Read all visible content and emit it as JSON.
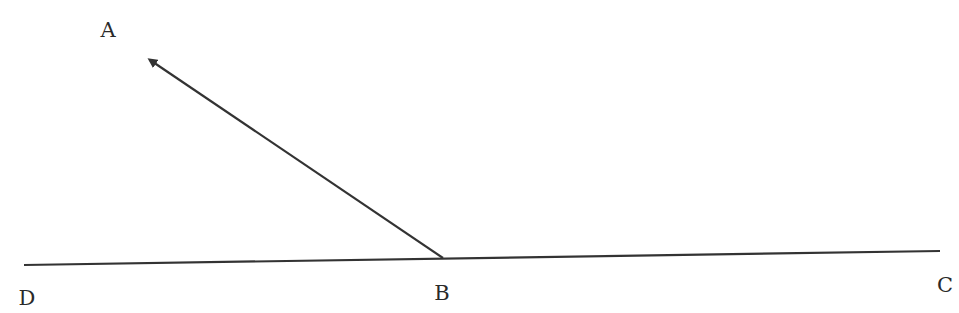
{
  "diagram": {
    "title": "",
    "stroke_color": "#333333",
    "label_color": "#2a2a2a",
    "points": {
      "A": {
        "label": "A",
        "x": 108,
        "y": 30
      },
      "B": {
        "label": "B",
        "x": 442,
        "y": 293
      },
      "C": {
        "label": "C",
        "x": 945,
        "y": 285
      },
      "D": {
        "label": "D",
        "x": 27,
        "y": 298
      }
    },
    "segments": [
      {
        "name": "line-DC",
        "from": [
          24,
          265
        ],
        "to": [
          940,
          251
        ],
        "arrow": false
      },
      {
        "name": "ray-BA",
        "from": [
          443,
          258
        ],
        "to": [
          146,
          57
        ],
        "arrow": true
      }
    ]
  }
}
